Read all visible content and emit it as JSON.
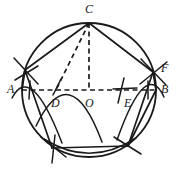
{
  "figure": {
    "ink_color": "#1a1a1a",
    "background_color": "#ffffff",
    "stroke_width": 1.6,
    "dash_pattern": "5 3",
    "circle": {
      "cx": 89,
      "cy": 90,
      "r": 67
    },
    "points": [
      {
        "id": "A",
        "label": "A",
        "x": 22,
        "y": 90,
        "label_x": 7,
        "label_y": 83
      },
      {
        "id": "B",
        "label": "B",
        "x": 156,
        "y": 90,
        "label_x": 161,
        "label_y": 83
      },
      {
        "id": "C",
        "label": "C",
        "x": 89,
        "y": 23,
        "label_x": 85,
        "label_y": 3
      },
      {
        "id": "D",
        "label": "D",
        "x": 56,
        "y": 90,
        "label_x": 51,
        "label_y": 97
      },
      {
        "id": "E",
        "label": "E",
        "x": 127,
        "y": 90,
        "label_x": 124,
        "label_y": 97
      },
      {
        "id": "F",
        "label": "F",
        "x": 153,
        "y": 72,
        "label_x": 161,
        "label_y": 63
      },
      {
        "id": "O",
        "label": "O",
        "x": 89,
        "y": 90,
        "label_x": 85,
        "label_y": 97
      }
    ],
    "solid_segments": [
      {
        "name": "chord-A-to-upper-left-vertex",
        "x1": 22,
        "y1": 90,
        "x2": 25,
        "y2": 70
      },
      {
        "name": "chord-upper-left-to-C",
        "x1": 25,
        "y1": 70,
        "x2": 89,
        "y2": 23
      },
      {
        "name": "chord-C-to-F",
        "x1": 89,
        "y1": 23,
        "x2": 153,
        "y2": 72
      },
      {
        "name": "chord-F-to-B",
        "x1": 153,
        "y1": 72,
        "x2": 156,
        "y2": 90
      },
      {
        "name": "chord-left-vertex-to-bottom-left",
        "x1": 25,
        "y1": 70,
        "x2": 52,
        "y2": 148
      },
      {
        "name": "chord-bottom-left-to-bottom-right",
        "x1": 52,
        "y1": 148,
        "x2": 128,
        "y2": 146
      },
      {
        "name": "chord-bottom-right-to-F",
        "x1": 128,
        "y1": 146,
        "x2": 153,
        "y2": 72
      },
      {
        "name": "chord-B-to-bottom-right",
        "x1": 156,
        "y1": 90,
        "x2": 128,
        "y2": 146
      }
    ],
    "dashed_segments": [
      {
        "name": "diameter-A-to-B",
        "x1": 22,
        "y1": 90,
        "x2": 156,
        "y2": 90
      },
      {
        "name": "altitude-C-to-O",
        "x1": 89,
        "y1": 23,
        "x2": 89,
        "y2": 90
      },
      {
        "name": "line-C-to-D",
        "x1": 89,
        "y1": 23,
        "x2": 56,
        "y2": 90
      }
    ],
    "tick_marks": [
      {
        "name": "tick-at-D",
        "x1": 61,
        "y1": 79,
        "x2": 53,
        "y2": 94
      },
      {
        "name": "tick-at-E-vertical",
        "x1": 124,
        "y1": 78,
        "x2": 118,
        "y2": 103
      },
      {
        "name": "tick-at-E-horizontal",
        "x1": 113,
        "y1": 89,
        "x2": 136,
        "y2": 88
      },
      {
        "name": "tick-at-A-vertical",
        "x1": 30,
        "y1": 81,
        "x2": 29,
        "y2": 99
      },
      {
        "name": "tick-at-B-vertical",
        "x1": 148,
        "y1": 81,
        "x2": 148,
        "y2": 99
      },
      {
        "name": "tick-bottom-left-vertical",
        "x1": 54,
        "y1": 135,
        "x2": 52,
        "y2": 163
      }
    ],
    "arc_marks": [
      {
        "name": "arc-mark-left-upper",
        "d": "M 14 58 L 38 84"
      },
      {
        "name": "arc-mark-left-lower",
        "d": "M 15 80 L 38 66"
      },
      {
        "name": "arc-mark-right-upper",
        "d": "M 141 59 L 166 85"
      },
      {
        "name": "arc-mark-right-lower",
        "d": "M 140 84 L 167 62"
      },
      {
        "name": "arc-mark-bottom-left",
        "d": "M 41 137 L 66 157"
      },
      {
        "name": "arc-mark-bottom-right",
        "d": "M 114 137 L 141 154"
      }
    ],
    "construction_arcs": [
      {
        "name": "arc-from-A-through-left-vertex",
        "d": "M 12 98 Q 31 62 62 143"
      },
      {
        "name": "arc-from-B-through-F",
        "d": "M 164 97 Q 146 58 117 140"
      },
      {
        "name": "arc-from-C-left",
        "d": "M 36 126 Q 70 56 102 142"
      },
      {
        "name": "arc-sweep-bottom",
        "d": "M 44 139 Q 90 168 136 138"
      }
    ]
  }
}
